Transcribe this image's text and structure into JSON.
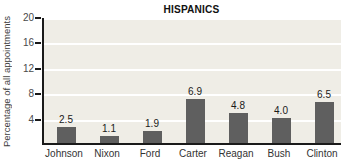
{
  "chart_data": {
    "type": "bar",
    "title": "HISPANICS",
    "ylabel": "Percentage of all appointments",
    "xlabel": "",
    "categories": [
      "Johnson",
      "Nixon",
      "Ford",
      "Carter",
      "Reagan",
      "Bush",
      "Clinton"
    ],
    "values": [
      2.5,
      1.1,
      1.9,
      6.9,
      4.8,
      4.0,
      6.5
    ],
    "value_labels": [
      "2.5",
      "1.1",
      "1.9",
      "6.9",
      "4.8",
      "4.0",
      "6.5"
    ],
    "ylim": [
      0,
      20
    ],
    "yticks": [
      20,
      16,
      12,
      8,
      4
    ],
    "grid": true,
    "legend": "none",
    "colors": {
      "bar": "#5f5f5f",
      "plot_background": "#efede6",
      "gridline": "#ffffff",
      "axis": "#1a1a1a",
      "title_text": "#111111",
      "tick_text": "#4a4a4a",
      "label_text": "#333333"
    }
  }
}
